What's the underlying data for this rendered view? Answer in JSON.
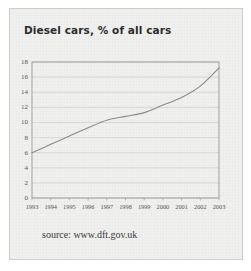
{
  "document": {
    "kind": "scanned-chart-figure",
    "card_background": "#f0f0ee",
    "page_background": "#ffffff"
  },
  "chart_data": {
    "type": "line",
    "title": "Diesel cars, % of all cars",
    "xlabel": "",
    "ylabel": "",
    "categories": [
      "1993",
      "1994",
      "1995",
      "1996",
      "1997",
      "1998",
      "1999",
      "2000",
      "2001",
      "2002",
      "2003"
    ],
    "x": [
      1993,
      1994,
      1995,
      1996,
      1997,
      1998,
      1999,
      2000,
      2001,
      2002,
      2003
    ],
    "values": [
      6.0,
      7.1,
      8.2,
      9.3,
      10.3,
      10.8,
      11.3,
      12.3,
      13.3,
      14.8,
      17.2
    ],
    "series": [
      {
        "name": "Diesel cars, % of all cars",
        "values": [
          6.0,
          7.1,
          8.2,
          9.3,
          10.3,
          10.8,
          11.3,
          12.3,
          13.3,
          14.8,
          17.2
        ],
        "color": "#8b8b8b"
      }
    ],
    "ylim": [
      0,
      18
    ],
    "xlim": [
      1993,
      2003
    ],
    "yticks": [
      0,
      2,
      4,
      6,
      8,
      10,
      12,
      14,
      16,
      18
    ],
    "ytick_labels": [
      "0",
      "2",
      "4",
      "6",
      "8",
      "10",
      "12",
      "14",
      "16",
      "18"
    ],
    "xtick_labels": [
      "1993",
      "1994",
      "1995",
      "1996",
      "1997",
      "1998",
      "1999",
      "2000",
      "2001",
      "2002",
      "2003"
    ],
    "grid": "horizontal",
    "grid_color": "#c8c8c4",
    "frame_color": "#9a9a98",
    "legend": "none",
    "legend_position": "none",
    "annotations": []
  },
  "caption": {
    "source_text": "source: www.dft.gov.uk"
  }
}
